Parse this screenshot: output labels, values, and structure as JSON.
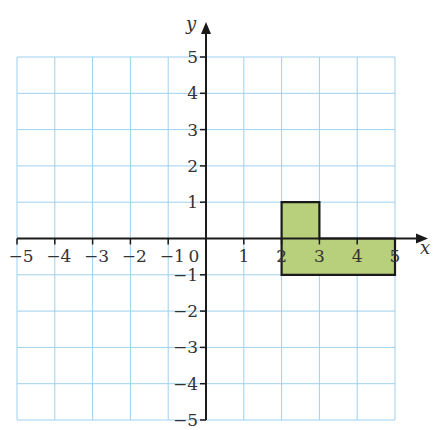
{
  "chart_data": {
    "type": "scatter",
    "title": "",
    "xlabel": "x",
    "ylabel": "y",
    "xlim": [
      -5,
      5
    ],
    "ylim": [
      -5,
      5
    ],
    "grid": true,
    "x_ticks": [
      "−5",
      "−4",
      "−3",
      "−2",
      "−1",
      "0",
      "1",
      "2",
      "3",
      "4",
      "5"
    ],
    "y_ticks": [
      "5",
      "4",
      "3",
      "2",
      "1",
      "−1",
      "−2",
      "−3",
      "−4",
      "−5"
    ],
    "shapes": [
      {
        "name": "L-shaped polygon",
        "vertices": [
          [
            2,
            1
          ],
          [
            3,
            1
          ],
          [
            3,
            0
          ],
          [
            5,
            0
          ],
          [
            5,
            -1
          ],
          [
            2,
            -1
          ]
        ],
        "fill": "#b8d07c",
        "stroke": "#1a1a1a"
      }
    ]
  },
  "colors": {
    "grid": "#9fd0ee",
    "axis": "#1a1a1a",
    "shape_fill": "#b8d07c"
  },
  "labels": {
    "x_axis": "x",
    "y_axis": "y",
    "origin": "0"
  }
}
